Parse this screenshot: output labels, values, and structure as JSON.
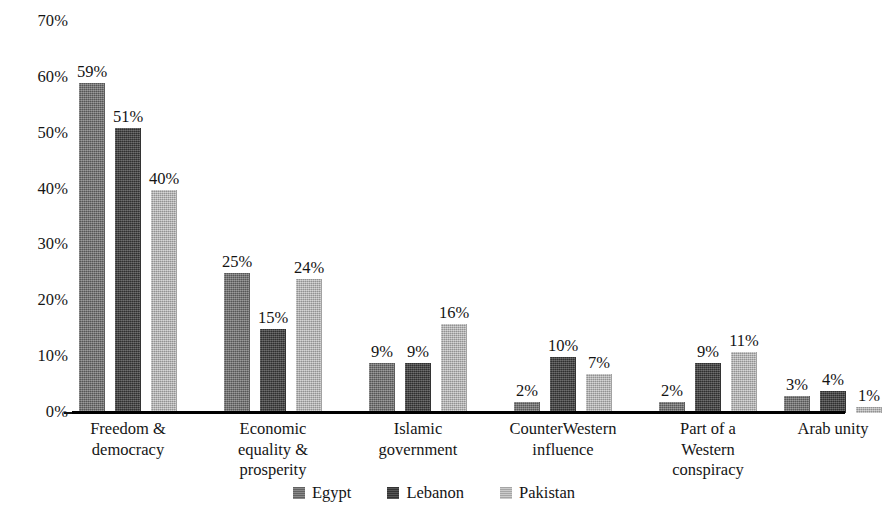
{
  "chart_data": {
    "type": "bar",
    "title": "",
    "subtitle": "",
    "xlabel": "",
    "ylabel": "",
    "ylim": [
      0,
      70
    ],
    "ytick_step": 10,
    "grid": false,
    "legend_position": "bottom",
    "value_label_suffix": "%",
    "categories": [
      [
        "Freedom &",
        "democracy"
      ],
      [
        "Economic",
        "equality &",
        "prosperity"
      ],
      [
        "Islamic",
        "government"
      ],
      [
        "CounterWestern",
        "influence"
      ],
      [
        "Part of a",
        "Western",
        "conspiracy"
      ],
      [
        "Arab unity"
      ]
    ],
    "category_labels_flat": [
      "Freedom & democracy",
      "Economic equality & prosperity",
      "Islamic government",
      "CounterWestern influence",
      "Part of a Western conspiracy",
      "Arab unity"
    ],
    "ytick_labels": [
      "70%",
      "60%",
      "50%",
      "40%",
      "30%",
      "20%",
      "10%",
      "0%"
    ],
    "ytick_values": [
      70,
      60,
      50,
      40,
      30,
      20,
      10,
      0
    ],
    "series": [
      {
        "name": "Egypt",
        "color": "#6d6d6d",
        "values": [
          59,
          25,
          9,
          2,
          2,
          3
        ],
        "value_labels": [
          "59%",
          "25%",
          "9%",
          "2%",
          "2%",
          "3%"
        ]
      },
      {
        "name": "Lebanon",
        "color": "#3f3f3f",
        "values": [
          51,
          15,
          9,
          10,
          9,
          4
        ],
        "value_labels": [
          "51%",
          "15%",
          "9%",
          "10%",
          "9%",
          "4%"
        ]
      },
      {
        "name": "Pakistan",
        "color": "#b3b3b3",
        "values": [
          40,
          24,
          16,
          7,
          11,
          1
        ],
        "value_labels": [
          "40%",
          "24%",
          "16%",
          "7%",
          "11%",
          "1%"
        ]
      }
    ]
  },
  "legend": {
    "items": [
      {
        "label": "Egypt",
        "key": "egypt"
      },
      {
        "label": "Lebanon",
        "key": "lebanon"
      },
      {
        "label": "Pakistan",
        "key": "pakistan"
      }
    ]
  }
}
